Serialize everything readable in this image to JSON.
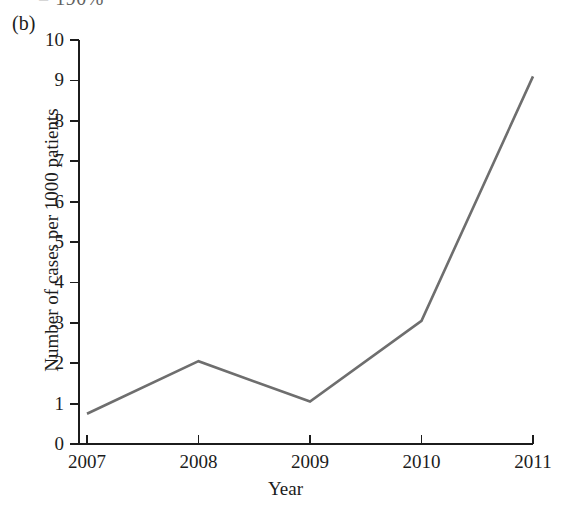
{
  "figure": {
    "panel_label": "(b)",
    "top_fragment": "= 190%",
    "background_color": "#ffffff",
    "axis_color": "#1c1c1c",
    "line_color": "#6e6e6e"
  },
  "chart_data": {
    "type": "line",
    "title": "",
    "subtitle": "",
    "xlabel": "Year",
    "ylabel": "Number of cases per 1000 patients",
    "x": [
      "2007",
      "2008",
      "2009",
      "2010",
      "2011"
    ],
    "values": [
      0.75,
      2.05,
      1.05,
      3.05,
      9.1
    ],
    "series": [
      {
        "name": "Number of cases per 1000 patients",
        "color": "#6e6e6e",
        "values": [
          0.75,
          2.05,
          1.05,
          3.05,
          9.1
        ]
      }
    ],
    "xtick_labels": [
      "2007",
      "2008",
      "2009",
      "2010",
      "2011"
    ],
    "ytick_labels": [
      "0",
      "1",
      "2",
      "3",
      "4",
      "5",
      "6",
      "7",
      "8",
      "9",
      "10"
    ],
    "ytick_values": [
      0,
      1,
      2,
      3,
      4,
      5,
      6,
      7,
      8,
      9,
      10
    ],
    "ylim": [
      0,
      10
    ],
    "xlim": [
      "2007",
      "2011"
    ],
    "grid": false,
    "legend": false,
    "legend_position": "none",
    "markers": false,
    "annotations": []
  }
}
